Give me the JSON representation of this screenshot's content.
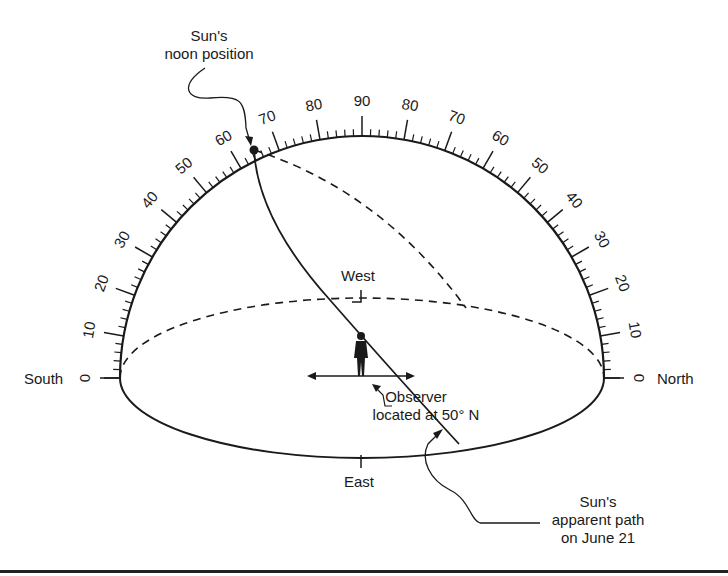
{
  "diagram": {
    "scale": {
      "min": 0,
      "max": 90,
      "major_step": 10,
      "minor_step": 2,
      "left_labels": [
        "0",
        "10",
        "20",
        "30",
        "40",
        "50",
        "60",
        "70",
        "80"
      ],
      "top_label": "90",
      "right_labels": [
        "80",
        "70",
        "60",
        "50",
        "40",
        "30",
        "20",
        "10",
        "0"
      ]
    },
    "directions": {
      "south": "South",
      "north": "North",
      "west": "West",
      "east": "East"
    },
    "annotations": {
      "noon_line1": "Sun's",
      "noon_line2": "noon position",
      "observer_line1": "Observer",
      "observer_line2": "located at 50° N",
      "path_line1": "Sun's",
      "path_line2": "apparent path",
      "path_line3": "on June 21"
    },
    "sun_noon_altitude_deg": 63.5,
    "observer_latitude_deg": 50,
    "date": "June 21",
    "colors": {
      "ink": "#1a1a1a",
      "background": "#ffffff"
    }
  }
}
